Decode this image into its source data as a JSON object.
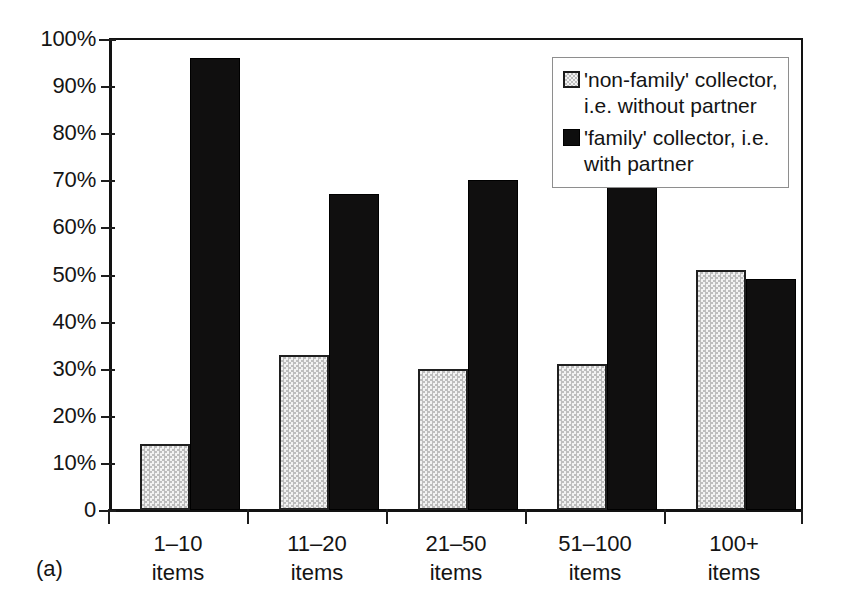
{
  "figure": {
    "panel_tag": "(a)"
  },
  "chart_data": {
    "type": "bar",
    "title": "",
    "xlabel": "",
    "ylabel": "",
    "ylim": [
      0,
      100
    ],
    "grid": false,
    "legend_position": "top-right",
    "categories": [
      "1–10 items",
      "11–20 items",
      "21–50 items",
      "51–100 items",
      "100+ items"
    ],
    "category_lines": [
      {
        "range": "1–10",
        "unit": "items"
      },
      {
        "range": "11–20",
        "unit": "items"
      },
      {
        "range": "21–50",
        "unit": "items"
      },
      {
        "range": "51–100",
        "unit": "items"
      },
      {
        "range": "100+",
        "unit": "items"
      }
    ],
    "ytick_labels": [
      "100%",
      "90%",
      "80%",
      "70%",
      "60%",
      "50%",
      "40%",
      "30%",
      "20%",
      "10%",
      "0"
    ],
    "ytick_values": [
      100,
      90,
      80,
      70,
      60,
      50,
      40,
      30,
      20,
      10,
      0
    ],
    "series": [
      {
        "name": "'non-family' collector, i.e. without partner",
        "legend_line1": "'non-family' collector,",
        "legend_line2": "i.e. without partner",
        "swatch": "light-checker",
        "color": "#dcdcdc",
        "values": [
          14,
          33,
          30,
          31,
          51
        ]
      },
      {
        "name": "'family' collector, i.e. with partner",
        "legend_line1": "'family' collector, i.e.",
        "legend_line2": "with partner",
        "swatch": "solid-black",
        "color": "#100f0f",
        "values": [
          96,
          67,
          70,
          69,
          49
        ]
      }
    ]
  }
}
